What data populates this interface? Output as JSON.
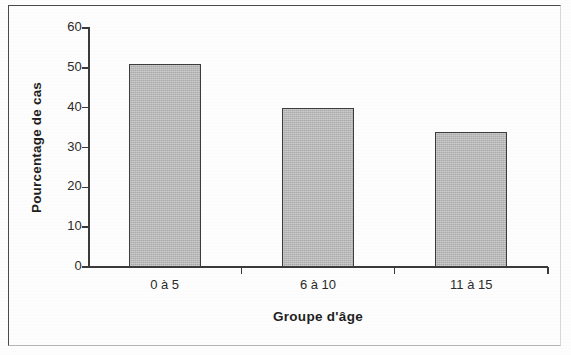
{
  "chart_data": {
    "type": "bar",
    "title": "",
    "subtitle": "",
    "xlabel": "Groupe d'âge",
    "ylabel": "Pourcentage de cas",
    "categories": [
      "0 à 5",
      "6 à 10",
      "11 à 15"
    ],
    "values": [
      51,
      40,
      34
    ],
    "series": [
      {
        "name": "Pourcentage de cas",
        "values": [
          51,
          40,
          34
        ]
      }
    ],
    "ylim": [
      0,
      60
    ],
    "y_ticks": [
      0,
      10,
      20,
      30,
      40,
      50,
      60
    ],
    "y_tick_labels": [
      "0",
      "10",
      "20",
      "30",
      "40",
      "50",
      "60"
    ],
    "grid": false,
    "legend": null,
    "legend_position": "none",
    "annotations": [],
    "colors": {
      "bar_fill": "#b9b9b9",
      "bar_stroke": "#3c3c3c",
      "axis": "#3a3a3a",
      "text": "#1f1f1f",
      "frame": "#4a4a4a",
      "background": "#fdfdfd"
    }
  },
  "figure": {
    "frame_visible": true
  }
}
